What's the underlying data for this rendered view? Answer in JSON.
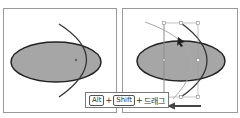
{
  "panels": [
    {
      "id": "before",
      "shape": "ellipse",
      "fill": "#a6a6a6",
      "stroke": "#222222"
    },
    {
      "id": "after",
      "shape": "ellipse",
      "fill": "#a6a6a6",
      "stroke": "#222222"
    }
  ],
  "instruction": {
    "key1": "Alt",
    "plus1": "+",
    "key2": "Shift",
    "plus2": "+",
    "action": "드래그"
  },
  "colors": {
    "ellipse_fill": "#a6a6a6",
    "stroke": "#222222",
    "guide": "#aaaaaa",
    "border": "#9a9a9a"
  }
}
